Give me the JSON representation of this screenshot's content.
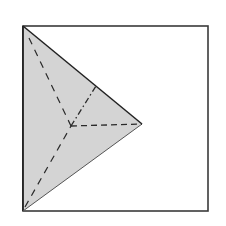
{
  "diagram": {
    "colors": {
      "background": "#ffffff",
      "frame_stroke": "#3a3a3a",
      "face_fill": "#d4d4d4",
      "edge_stroke": "#222222",
      "lower_edge_stroke": "#555555",
      "hidden_stroke": "#2a2a2a"
    },
    "frame": {
      "x": 23,
      "y": 26,
      "width": 185,
      "height": 185
    },
    "vertices": {
      "top_left": [
        23,
        26
      ],
      "bottom_left": [
        23,
        211
      ],
      "apex_right": [
        142,
        124
      ],
      "center": [
        71,
        126
      ],
      "upper_edge_point": [
        96,
        86
      ]
    },
    "edges": [
      {
        "name": "left-edge",
        "from": "top_left",
        "to": "bottom_left",
        "style": "solid"
      },
      {
        "name": "upper-edge",
        "from": "top_left",
        "to": "apex_right",
        "style": "solid"
      },
      {
        "name": "lower-edge",
        "from": "bottom_left",
        "to": "apex_right",
        "style": "solid-thin"
      },
      {
        "name": "hidden-edge-top",
        "from": "top_left",
        "to": "center",
        "style": "dashed"
      },
      {
        "name": "hidden-edge-bottom",
        "from": "bottom_left",
        "to": "center",
        "style": "dashed"
      },
      {
        "name": "hidden-edge-right",
        "from": "center",
        "to": "apex_right",
        "style": "dashed"
      },
      {
        "name": "hidden-edge-dashdot",
        "from": "center",
        "to": "upper_edge_point",
        "style": "dash-dot"
      }
    ]
  }
}
